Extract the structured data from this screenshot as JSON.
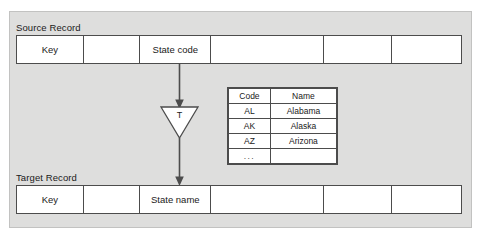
{
  "diagram": {
    "source": {
      "label": "Source Record",
      "cells": [
        "Key",
        "",
        "State code",
        "",
        "",
        ""
      ]
    },
    "target": {
      "label": "Target Record",
      "cells": [
        "Key",
        "",
        "State name",
        "",
        "",
        ""
      ]
    },
    "transform": {
      "symbol": "T"
    },
    "lookup": {
      "headers": [
        "Code",
        "Name"
      ],
      "rows": [
        [
          "AL",
          "Alabama"
        ],
        [
          "AK",
          "Alaska"
        ],
        [
          "AZ",
          "Arizona"
        ],
        [
          "...",
          ""
        ]
      ]
    },
    "colors": {
      "panel_background": "#dededd",
      "panel_border": "#c2c2c1",
      "line": "#4c4c4c",
      "cell_background": "#ffffff",
      "text": "#1a1a1a"
    }
  }
}
